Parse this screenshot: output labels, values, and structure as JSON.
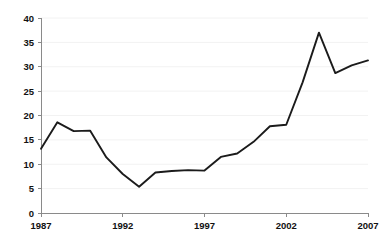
{
  "chart_data": {
    "type": "line",
    "title": "",
    "subtitle": "",
    "xlabel": "",
    "ylabel": "",
    "xlim": [
      1987,
      2007
    ],
    "ylim": [
      0,
      40
    ],
    "grid": true,
    "legend": "none",
    "x_tick_labels": [
      "1987",
      "1992",
      "1997",
      "2002",
      "2007"
    ],
    "x_ticks": [
      1987,
      1992,
      1997,
      2002,
      2007
    ],
    "y_tick_labels": [
      "0",
      "5",
      "10",
      "15",
      "20",
      "25",
      "30",
      "35",
      "40"
    ],
    "y_ticks": [
      0,
      5,
      10,
      15,
      20,
      25,
      30,
      35,
      40
    ],
    "x": [
      1987,
      1988,
      1989,
      1990,
      1991,
      1992,
      1993,
      1994,
      1995,
      1996,
      1997,
      1998,
      1999,
      2000,
      2001,
      2002,
      2003,
      2004,
      2005,
      2006,
      2007
    ],
    "series": [
      {
        "name": "value",
        "color": "#1b1b1b",
        "values": [
          13.2,
          18.6,
          16.8,
          16.9,
          11.4,
          8.0,
          5.4,
          8.3,
          8.6,
          8.8,
          8.7,
          11.5,
          12.2,
          14.6,
          17.8,
          18.1,
          26.8,
          37.0,
          28.7,
          30.3,
          31.3
        ]
      }
    ]
  },
  "axes": {
    "y_axis_name": "y-axis",
    "x_axis_name": "x-axis"
  }
}
